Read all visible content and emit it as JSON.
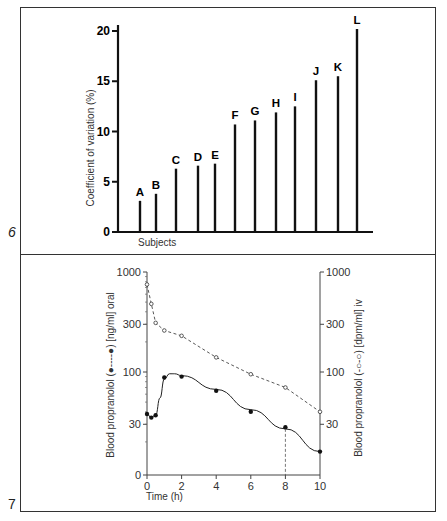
{
  "figures": [
    {
      "number": "6"
    },
    {
      "number": "7"
    }
  ],
  "chart_data": [
    {
      "type": "bar",
      "title": "",
      "xlabel": "Subjects",
      "ylabel": "Coefficient of variation (%)",
      "categories": [
        "A",
        "B",
        "C",
        "D",
        "E",
        "F",
        "G",
        "H",
        "I",
        "J",
        "K",
        "L"
      ],
      "values": [
        3.1,
        3.8,
        6.3,
        6.6,
        6.8,
        10.7,
        11.1,
        11.9,
        12.5,
        15.1,
        15.5,
        20.2
      ],
      "ylim": [
        0,
        21
      ],
      "yticks": [
        "0",
        "5",
        "10",
        "15",
        "20"
      ],
      "grid": false,
      "legend": null
    },
    {
      "type": "line",
      "title": "",
      "xlabel": "Time (h)",
      "ylabel_left": "Blood propranolol (●----●) [ng/ml] oral",
      "ylabel_right": "Blood propranolol (-○-○) [dpm/ml] iv",
      "xticks": [
        "0",
        "2",
        "4",
        "6",
        "8",
        "10"
      ],
      "yticks_left": [
        "0",
        "30",
        "100",
        "300",
        "1000"
      ],
      "yticks_right": [
        "30",
        "100",
        "300",
        "1000"
      ],
      "yscale": "log",
      "xlim": [
        0,
        10
      ],
      "ylim": [
        10,
        1000
      ],
      "series": [
        {
          "name": "oral (filled circles, solid line)",
          "x": [
            0,
            0.25,
            0.5,
            1,
            2,
            4,
            6,
            8,
            10
          ],
          "y": [
            38,
            35,
            37,
            88,
            90,
            65,
            40,
            28,
            16
          ]
        },
        {
          "name": "iv (open circles, dashed line)",
          "x": [
            0,
            0.25,
            0.5,
            1,
            2,
            4,
            6,
            8,
            10
          ],
          "y": [
            750,
            480,
            310,
            260,
            230,
            140,
            95,
            70,
            40
          ]
        }
      ],
      "annotations": [
        "dashed vertical drop line at t=8 h"
      ],
      "grid": false
    }
  ]
}
